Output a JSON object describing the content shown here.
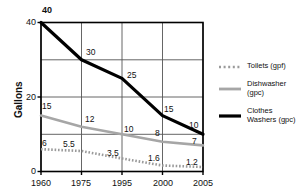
{
  "chart_data": {
    "type": "line",
    "title": "",
    "xlabel": "",
    "ylabel": "Gallons",
    "categories": [
      "1960",
      "1975",
      "1995",
      "2000",
      "2005"
    ],
    "ylim": [
      0,
      40
    ],
    "yticks": [
      "0",
      "20",
      "40"
    ],
    "gridlines": {
      "horizontal_at": [
        0,
        10,
        20,
        30,
        40
      ],
      "vertical_at": [
        "1960",
        "1975",
        "1995",
        "2000",
        "2005"
      ],
      "grid": true
    },
    "legend_position": "right",
    "series": [
      {
        "name": "Toilets (gpf)",
        "style": "dotted",
        "color": "#9a9a9a",
        "values": [
          6,
          5.5,
          3.5,
          1.6,
          1.2
        ],
        "labels": [
          "6",
          "5.5",
          "3.5",
          "1.6",
          "1.2"
        ]
      },
      {
        "name": "Dishwasher (gpc)",
        "style": "solid",
        "color": "#a6a6a6",
        "values": [
          15,
          12,
          10,
          8,
          7
        ],
        "labels": [
          "15",
          "12",
          "10",
          "8",
          "7"
        ]
      },
      {
        "name": "Clothes Washers (gpc)",
        "style": "solid",
        "color": "#000000",
        "values": [
          40,
          30,
          25,
          15,
          10
        ],
        "labels": [
          "40",
          "30",
          "25",
          "15",
          "10"
        ]
      }
    ]
  },
  "axis": {
    "y_title": "Gallons",
    "y_ticks": {
      "t0": "0",
      "t20": "20",
      "t40": "40"
    },
    "x_ticks": {
      "t1960": "1960",
      "t1975": "1975",
      "t1995": "1995",
      "t2000": "2000",
      "t2005": "2005"
    }
  },
  "labels": {
    "cw_1960": "40",
    "cw_1975": "30",
    "cw_1995": "25",
    "cw_2000": "15",
    "cw_2005": "10",
    "dw_1960": "15",
    "dw_1975": "12",
    "dw_1995": "10",
    "dw_2000": "8",
    "dw_2005": "7",
    "tl_1960": "6",
    "tl_1975": "5.5",
    "tl_1995": "3.5",
    "tl_2000": "1.6",
    "tl_2005": "1.2"
  },
  "legend": {
    "items": [
      {
        "label": "Toilets (gpf)",
        "label_line1": "Toilets (gpf)",
        "label_line2": ""
      },
      {
        "label": "Dishwasher (gpc)",
        "label_line1": "Dishwasher",
        "label_line2": "(gpc)"
      },
      {
        "label": "Clothes Washers (gpc)",
        "label_line1": "Clothes",
        "label_line2": "Washers (gpc)"
      }
    ]
  },
  "colors": {
    "toilets": "#9a9a9a",
    "dishwasher": "#a6a6a6",
    "clothes_washers": "#000000",
    "axis": "#000000",
    "grid": "#555555"
  }
}
